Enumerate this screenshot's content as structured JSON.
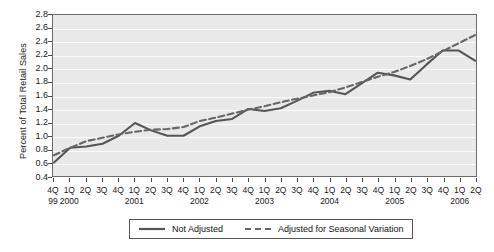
{
  "chart_data": {
    "type": "line",
    "title": "",
    "xlabel": "",
    "ylabel": "Percent of Total Retail Sales",
    "ylim": [
      0.4,
      2.8
    ],
    "ytick_labels": [
      "2.8",
      "2.6",
      "2.4",
      "2.2",
      "2.0",
      "1.8",
      "1.6",
      "1.4",
      "1.2",
      "1.0",
      "0.8",
      "0.6",
      "0.4"
    ],
    "ytick_values": [
      2.8,
      2.6,
      2.4,
      2.2,
      2.0,
      1.8,
      1.6,
      1.4,
      1.2,
      1.0,
      0.8,
      0.6,
      0.4
    ],
    "grid": true,
    "legend_position": "bottom-center",
    "categories": [
      "4Q 99",
      "1Q 2000",
      "2Q 2000",
      "3Q 2000",
      "4Q 2000",
      "1Q 2001",
      "2Q 2001",
      "3Q 2001",
      "4Q 2001",
      "1Q 2002",
      "2Q 2002",
      "3Q 2002",
      "4Q 2002",
      "1Q 2003",
      "2Q 2003",
      "3Q 2003",
      "4Q 2003",
      "1Q 2004",
      "2Q 2004",
      "3Q 2004",
      "4Q 2004",
      "1Q 2005",
      "2Q 2005",
      "3Q 2005",
      "4Q 2005",
      "1Q 2006",
      "2Q 2006"
    ],
    "quarter_labels": [
      "4Q",
      "1Q",
      "2Q",
      "3Q",
      "4Q",
      "1Q",
      "2Q",
      "3Q",
      "4Q",
      "1Q",
      "2Q",
      "3Q",
      "4Q",
      "1Q",
      "2Q",
      "3Q",
      "4Q",
      "1Q",
      "2Q",
      "3Q",
      "4Q",
      "1Q",
      "2Q",
      "3Q",
      "4Q",
      "1Q",
      "2Q"
    ],
    "year_labels": [
      {
        "index": 0,
        "text": "99"
      },
      {
        "index": 1,
        "text": "2000"
      },
      {
        "index": 5,
        "text": "2001"
      },
      {
        "index": 9,
        "text": "2002"
      },
      {
        "index": 13,
        "text": "2003"
      },
      {
        "index": 17,
        "text": "2004"
      },
      {
        "index": 21,
        "text": "2005"
      },
      {
        "index": 25,
        "text": "2006"
      }
    ],
    "series": [
      {
        "name": "Not Adjusted",
        "style": "solid",
        "color": "#555555",
        "values": [
          0.6,
          0.82,
          0.84,
          0.88,
          1.0,
          1.19,
          1.08,
          1.0,
          1.0,
          1.14,
          1.22,
          1.25,
          1.4,
          1.37,
          1.41,
          1.52,
          1.64,
          1.67,
          1.62,
          1.78,
          1.94,
          1.9,
          1.84,
          2.06,
          2.27,
          2.27,
          2.12
        ]
      },
      {
        "name": "Adjusted for Seasonal Variation",
        "style": "dashed",
        "color": "#666666",
        "values": [
          0.71,
          0.82,
          0.92,
          0.97,
          1.02,
          1.06,
          1.09,
          1.1,
          1.13,
          1.22,
          1.27,
          1.33,
          1.39,
          1.44,
          1.5,
          1.55,
          1.6,
          1.65,
          1.72,
          1.8,
          1.88,
          1.95,
          2.04,
          2.14,
          2.26,
          2.38,
          2.5
        ]
      }
    ]
  },
  "legend": {
    "entries": [
      {
        "label": "Not Adjusted"
      },
      {
        "label": "Adjusted for Seasonal Variation"
      }
    ]
  }
}
